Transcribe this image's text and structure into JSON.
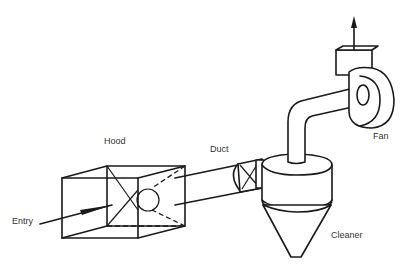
{
  "diagram": {
    "type": "local exhaust ventilation system schematic",
    "labels": {
      "hood": "Hood",
      "duct": "Duct",
      "fan": "Fan",
      "entry": "Entry",
      "cleaner": "Cleaner"
    },
    "components": [
      {
        "id": "hood",
        "label": "Hood",
        "shape": "open box with tapered interior"
      },
      {
        "id": "duct",
        "label": "Duct",
        "shape": "cylindrical pipe"
      },
      {
        "id": "cleaner",
        "label": "Cleaner",
        "shape": "cyclone (cylinder over cone)"
      },
      {
        "id": "fan",
        "label": "Fan",
        "shape": "centrifugal fan with outlet stack"
      }
    ],
    "flow": [
      "Entry",
      "Hood",
      "Duct",
      "Cleaner",
      "Fan",
      "exhaust"
    ],
    "colors": {
      "line": "#1a1a1a",
      "text": "#333333",
      "background": "#ffffff"
    }
  }
}
